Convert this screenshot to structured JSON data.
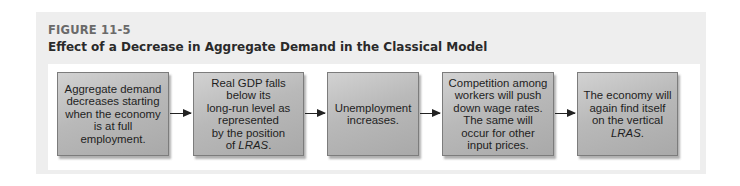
{
  "figure": {
    "label": "FIGURE 11-5",
    "title": "Effect of a Decrease in Aggregate Demand in the Classical Model"
  },
  "flowchart": {
    "steps": [
      {
        "lines": [
          "Aggregate demand",
          "decreases starting",
          "when the economy",
          "is at full employment."
        ]
      },
      {
        "lines": [
          "Real GDP falls",
          "below its",
          "long-run level as",
          "represented",
          "by the position"
        ],
        "last_prefix": "of ",
        "last_italic": "LRAS",
        "last_suffix": "."
      },
      {
        "lines": [
          "Unemployment",
          "increases."
        ]
      },
      {
        "lines": [
          "Competition among",
          "workers will push",
          "down wage rates.",
          "The same will",
          "occur for other",
          "input prices."
        ]
      },
      {
        "lines": [
          "The economy will",
          "again find itself",
          "on the vertical"
        ],
        "last_prefix": "",
        "last_italic": "LRAS",
        "last_suffix": "."
      }
    ],
    "arrow_count": 4,
    "colors": {
      "box_fill_light": "#d2d2d2",
      "box_fill_dark": "#a9a9a9",
      "box_border": "#7c7c7c",
      "arrow": "#222222",
      "panel_bg": "#eeeeee"
    }
  }
}
